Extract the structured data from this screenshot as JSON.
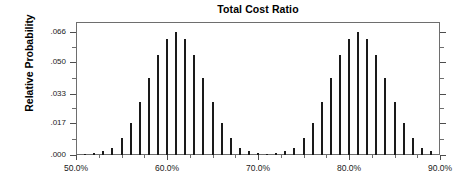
{
  "chart_data": {
    "type": "bar",
    "title": "Total Cost Ratio",
    "xlabel": "",
    "ylabel": "Relative Probability",
    "xlim": [
      50.0,
      90.0
    ],
    "ylim": [
      0.0,
      0.0715
    ],
    "grid": false,
    "legend": null,
    "xtick_labels": [
      "50.0%",
      "60.0%",
      "70.0%",
      "80.0%",
      "90.0%"
    ],
    "xtick_values": [
      50.0,
      60.0,
      70.0,
      80.0,
      90.0
    ],
    "xtick_minor_values": [
      52.5,
      55.0,
      57.5,
      62.5,
      65.0,
      67.5,
      72.5,
      75.0,
      77.5,
      82.5,
      85.0,
      87.5
    ],
    "ytick_labels": [
      ".000",
      ".017",
      ".033",
      ".050",
      ".066"
    ],
    "ytick_values": [
      0.0,
      0.017,
      0.033,
      0.05,
      0.066
    ],
    "ytick_minor_values": [
      0.0085,
      0.025,
      0.0415,
      0.058
    ],
    "bar_color": "#1a1a1a",
    "axis_color": "#6e6e6e",
    "x": [
      50.5,
      51.0,
      51.5,
      52.0,
      52.5,
      53.0,
      53.5,
      54.0,
      54.5,
      55.0,
      55.5,
      56.0,
      56.5,
      57.0,
      57.5,
      58.0,
      58.5,
      59.0,
      59.5,
      60.0,
      60.5,
      61.0,
      61.5,
      62.0,
      62.5,
      63.0,
      63.5,
      64.0,
      64.5,
      65.0,
      65.5,
      66.0,
      66.5,
      67.0,
      67.5,
      68.0,
      68.5,
      69.0,
      69.5,
      70.0,
      70.5,
      71.0,
      71.5,
      72.0,
      72.5,
      73.0,
      73.5,
      74.0,
      74.5,
      75.0,
      75.5,
      76.0,
      76.5,
      77.0,
      77.5,
      78.0,
      78.5,
      79.0,
      79.5,
      80.0,
      80.5,
      81.0,
      81.5,
      82.0,
      82.5,
      83.0,
      83.5,
      84.0,
      84.5,
      85.0,
      85.5,
      86.0,
      86.5,
      87.0,
      87.5,
      88.0,
      88.5,
      89.0,
      89.5
    ],
    "values": [
      0.0,
      0.0008,
      0.0,
      0.001,
      0.0,
      0.0022,
      0.0,
      0.004,
      0.0,
      0.0092,
      0.0,
      0.017,
      0.0,
      0.0285,
      0.0,
      0.0415,
      0.0,
      0.0535,
      0.0,
      0.0625,
      0.0,
      0.066,
      0.0,
      0.0625,
      0.0,
      0.0535,
      0.0,
      0.0415,
      0.0,
      0.0285,
      0.0,
      0.017,
      0.0,
      0.0092,
      0.0,
      0.004,
      0.0,
      0.0022,
      0.0,
      0.001,
      0.0,
      0.0008,
      0.0,
      0.001,
      0.0,
      0.0022,
      0.0,
      0.004,
      0.0,
      0.0092,
      0.0,
      0.017,
      0.0,
      0.0285,
      0.0,
      0.0415,
      0.0,
      0.0535,
      0.0,
      0.0625,
      0.0,
      0.066,
      0.0,
      0.0625,
      0.0,
      0.0535,
      0.0,
      0.0415,
      0.0,
      0.0285,
      0.0,
      0.017,
      0.0,
      0.0092,
      0.0,
      0.004,
      0.0,
      0.0022,
      0.0
    ],
    "bars": [
      {
        "x": 51.0,
        "y": 0.0008
      },
      {
        "x": 52.0,
        "y": 0.001
      },
      {
        "x": 53.0,
        "y": 0.0022
      },
      {
        "x": 54.0,
        "y": 0.004
      },
      {
        "x": 55.0,
        "y": 0.0092
      },
      {
        "x": 56.0,
        "y": 0.017
      },
      {
        "x": 57.0,
        "y": 0.0285
      },
      {
        "x": 58.0,
        "y": 0.0415
      },
      {
        "x": 59.0,
        "y": 0.0535
      },
      {
        "x": 60.0,
        "y": 0.0625
      },
      {
        "x": 61.0,
        "y": 0.066
      },
      {
        "x": 62.0,
        "y": 0.0625
      },
      {
        "x": 63.0,
        "y": 0.0535
      },
      {
        "x": 64.0,
        "y": 0.0415
      },
      {
        "x": 65.0,
        "y": 0.0285
      },
      {
        "x": 66.0,
        "y": 0.017
      },
      {
        "x": 67.0,
        "y": 0.0092
      },
      {
        "x": 68.0,
        "y": 0.004
      },
      {
        "x": 69.0,
        "y": 0.0022
      },
      {
        "x": 70.0,
        "y": 0.001
      },
      {
        "x": 71.0,
        "y": 0.0008
      },
      {
        "x": 72.0,
        "y": 0.001
      },
      {
        "x": 73.0,
        "y": 0.0022
      },
      {
        "x": 74.0,
        "y": 0.004
      },
      {
        "x": 75.0,
        "y": 0.0092
      },
      {
        "x": 76.0,
        "y": 0.017
      },
      {
        "x": 77.0,
        "y": 0.0285
      },
      {
        "x": 78.0,
        "y": 0.0415
      },
      {
        "x": 79.0,
        "y": 0.0535
      },
      {
        "x": 80.0,
        "y": 0.0625
      },
      {
        "x": 81.0,
        "y": 0.066
      },
      {
        "x": 82.0,
        "y": 0.0625
      },
      {
        "x": 83.0,
        "y": 0.0535
      },
      {
        "x": 84.0,
        "y": 0.0415
      },
      {
        "x": 85.0,
        "y": 0.0285
      },
      {
        "x": 86.0,
        "y": 0.017
      },
      {
        "x": 87.0,
        "y": 0.0092
      },
      {
        "x": 88.0,
        "y": 0.004
      },
      {
        "x": 89.0,
        "y": 0.0022
      }
    ]
  }
}
